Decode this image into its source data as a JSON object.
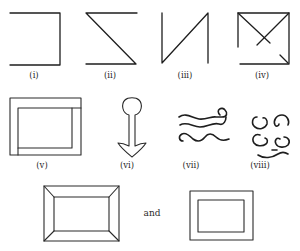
{
  "figure": {
    "figures": [
      {
        "id": "i",
        "label": "(i)",
        "shape": "open rectangle missing left side"
      },
      {
        "id": "ii",
        "label": "(ii)",
        "shape": "Z shape (top, diagonal, bottom)"
      },
      {
        "id": "iii",
        "label": "(iii)",
        "shape": "N shape"
      },
      {
        "id": "iv",
        "label": "(iv)",
        "shape": "square with crossed diagonals and gaps"
      },
      {
        "id": "v",
        "label": "(v)",
        "shape": "nested offset rectangles"
      },
      {
        "id": "vi",
        "label": "(vi)",
        "shape": "anchor / keyhole outline"
      },
      {
        "id": "vii",
        "label": "(vii)",
        "shape": "three wavy lines with curl"
      },
      {
        "id": "viii",
        "label": "(viii)",
        "shape": "four curls with smile stroke"
      }
    ],
    "bottom_row": {
      "connector_text": "and",
      "left": "beveled picture frame",
      "right": "plain double-rectangle frame"
    },
    "colors": {
      "ink": "#1e1e1e",
      "background": "#ffffff"
    }
  }
}
